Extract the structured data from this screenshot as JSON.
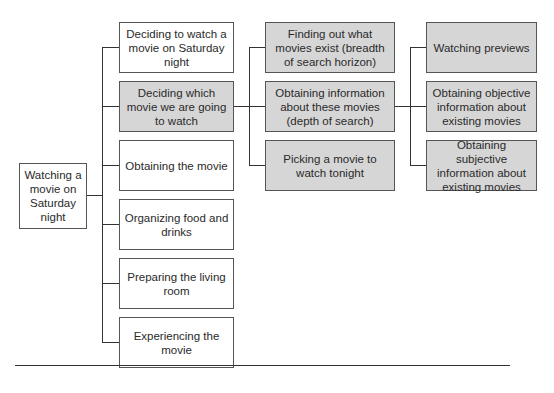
{
  "diagram": {
    "root": {
      "label": "Watching a movie on Saturday night"
    },
    "level1": [
      {
        "label": "Deciding to watch a movie on Saturday night",
        "shaded": false
      },
      {
        "label": "Deciding which movie we are going to watch",
        "shaded": true
      },
      {
        "label": "Obtaining the movie",
        "shaded": false
      },
      {
        "label": "Organizing food and drinks",
        "shaded": false
      },
      {
        "label": "Preparing the living room",
        "shaded": false
      },
      {
        "label": "Experiencing the movie",
        "shaded": false
      }
    ],
    "level2": [
      {
        "label": "Finding out what movies exist (breadth of search horizon)",
        "shaded": true
      },
      {
        "label": "Obtaining information about these movies (depth of search)",
        "shaded": true
      },
      {
        "label": "Picking a movie to watch tonight",
        "shaded": true
      }
    ],
    "level3": [
      {
        "label": "Watching previews",
        "shaded": true
      },
      {
        "label": "Obtaining objective information about existing movies",
        "shaded": true
      },
      {
        "label": "Obtaining subjective information about existing movies",
        "shaded": true
      }
    ]
  },
  "colors": {
    "shaded_fill": "#d6d6d6",
    "border": "#555555",
    "line": "#333333"
  }
}
